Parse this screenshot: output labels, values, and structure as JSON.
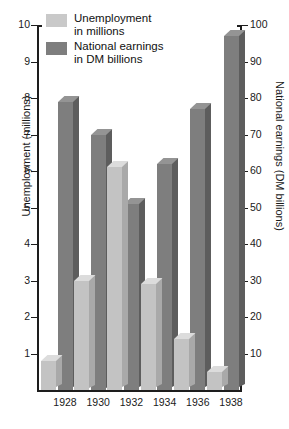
{
  "chart_data": {
    "type": "bar",
    "title": "",
    "categories": [
      "1928",
      "1930",
      "1932",
      "1934",
      "1936",
      "1938"
    ],
    "xlabel": "",
    "grid": false,
    "legend_position": "top-left",
    "series": [
      {
        "name": "Unemployment in millions",
        "axis": "left",
        "unit": "millions",
        "color": "#c3c3c3",
        "values": [
          0.8,
          3.0,
          6.1,
          2.9,
          1.4,
          0.5
        ]
      },
      {
        "name": "National earnings in DM billions",
        "axis": "right",
        "unit": "DM billions",
        "color": "#7e7e7e",
        "values": [
          79,
          70,
          51,
          62,
          77,
          97
        ]
      }
    ],
    "left_axis": {
      "label": "Unemployment (millions)",
      "ticks": [
        1,
        2,
        3,
        4,
        5,
        6,
        7,
        8,
        9,
        10
      ],
      "lim": [
        0,
        10
      ]
    },
    "right_axis": {
      "label": "National earnings (DM billions)",
      "ticks": [
        10,
        20,
        30,
        40,
        50,
        60,
        70,
        80,
        90,
        100
      ],
      "lim": [
        0,
        100
      ]
    }
  },
  "legend": {
    "items": [
      {
        "line1": "Unemployment",
        "line2": "in millions",
        "swatch": "#c9c9c9"
      },
      {
        "line1": "National earnings",
        "line2": "in DM billions",
        "swatch": "#7e7e7e"
      }
    ]
  }
}
